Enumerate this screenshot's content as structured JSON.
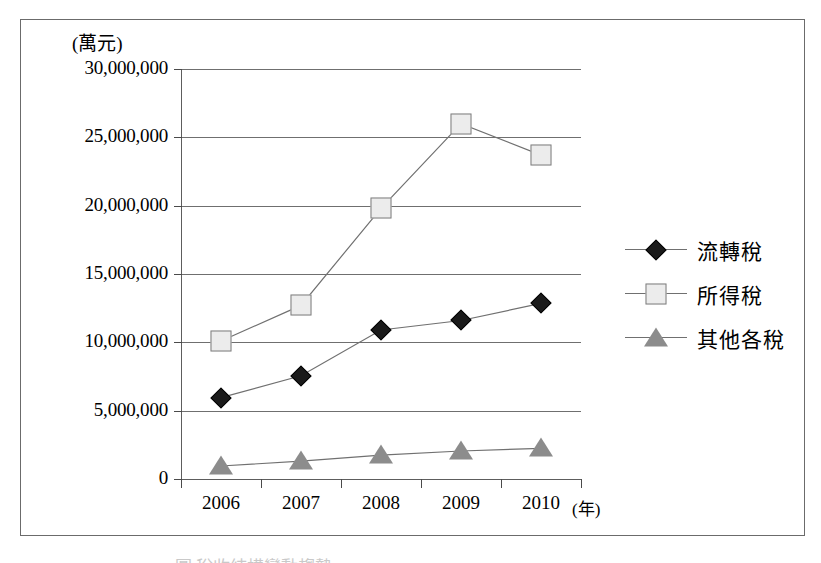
{
  "figure": {
    "y_axis_unit_label": "(萬元)",
    "x_axis_unit_label": "(年)"
  },
  "chart_data": {
    "type": "line",
    "title": "",
    "subtitle": "",
    "xlabel": "(年)",
    "ylabel": "(萬元)",
    "categories": [
      "2006",
      "2007",
      "2008",
      "2009",
      "2010"
    ],
    "ytick_labels": [
      "30,000,000",
      "25,000,000",
      "20,000,000",
      "15,000,000",
      "10,000,000",
      "5,000,000",
      "0"
    ],
    "ytick_values": [
      30000000,
      25000000,
      20000000,
      15000000,
      10000000,
      5000000,
      0
    ],
    "ylim": [
      0,
      30000000
    ],
    "grid": "horizontal",
    "legend_position": "right",
    "series": [
      {
        "name": "流轉稅",
        "marker": "diamond",
        "color": "#1a1a1a",
        "values": [
          5950000,
          7550000,
          10900000,
          11600000,
          12850000
        ]
      },
      {
        "name": "所得稅",
        "marker": "square",
        "color": "#ececec",
        "values": [
          10100000,
          12700000,
          19800000,
          26000000,
          23700000
        ]
      },
      {
        "name": "其他各稅",
        "marker": "triangle",
        "color": "#8c8c8c",
        "values": [
          950000,
          1300000,
          1750000,
          2050000,
          2250000
        ]
      }
    ]
  },
  "caption_sliver": "圖 稅收結構變動趨勢"
}
